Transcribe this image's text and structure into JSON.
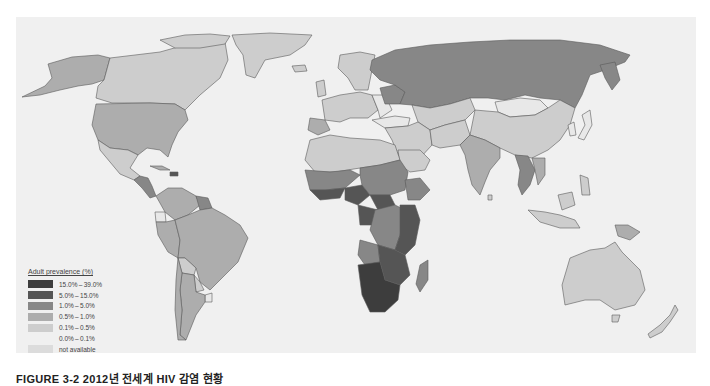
{
  "map": {
    "title": "Adult HIV prevalence world map",
    "background_color": "#f0f0f0",
    "border_color": "#5a5a5a",
    "regions": [
      {
        "name": "Southern Africa",
        "category": "15.0%–39.0%"
      },
      {
        "name": "East/Central Africa",
        "category": "5.0%–15.0%"
      },
      {
        "name": "West/Central Africa",
        "category": "1.0%–5.0%"
      },
      {
        "name": "Russia",
        "category": "1.0%–5.0%"
      },
      {
        "name": "Ukraine",
        "category": "1.0%–5.0%"
      },
      {
        "name": "Thailand/Myanmar",
        "category": "1.0%–5.0%"
      },
      {
        "name": "Papua New Guinea",
        "category": "0.5%–1.0%"
      },
      {
        "name": "United States",
        "category": "0.5%–1.0%"
      },
      {
        "name": "Brazil",
        "category": "0.5%–1.0%"
      },
      {
        "name": "Canada",
        "category": "0.1%–0.5%"
      },
      {
        "name": "China",
        "category": "0.1%–0.5%"
      },
      {
        "name": "India",
        "category": "0.1%–0.5%"
      },
      {
        "name": "Australia",
        "category": "0.1%–0.5%"
      },
      {
        "name": "Mongolia",
        "category": "0.0%–0.1%"
      }
    ]
  },
  "legend": {
    "title": "Adult prevalence (%)",
    "items": [
      {
        "label": "15.0% – 39.0%",
        "color": "#3d3d3d"
      },
      {
        "label": "5.0% – 15.0%",
        "color": "#555555"
      },
      {
        "label": "1.0% – 5.0%",
        "color": "#878787"
      },
      {
        "label": "0.5% – 1.0%",
        "color": "#adadad"
      },
      {
        "label": "0.1% – 0.5%",
        "color": "#cdcdcd"
      },
      {
        "label": "0.0% – 0.1%",
        "color": "#e8e8e8"
      },
      {
        "label": "not available",
        "color": "#dcdcdc"
      }
    ]
  },
  "caption": {
    "text": "FIGURE 3-2   2012년 전세계 HIV 감염 현황"
  }
}
